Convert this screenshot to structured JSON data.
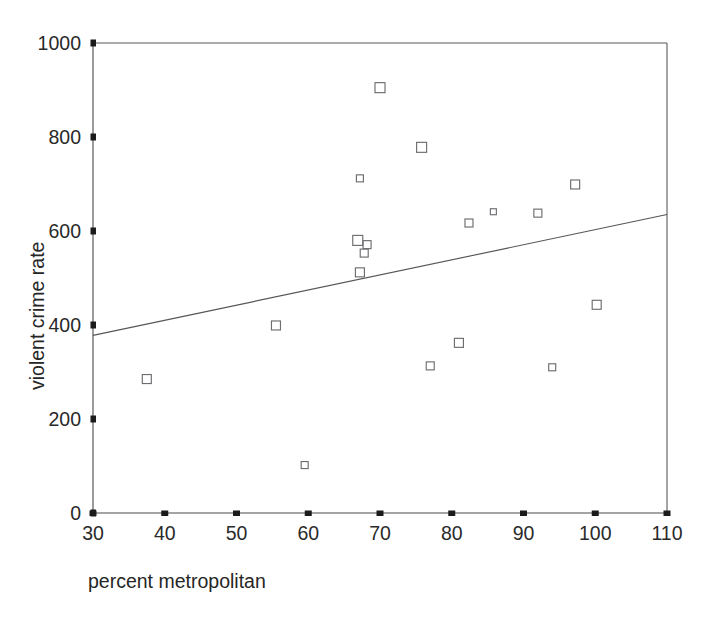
{
  "chart_data": {
    "type": "scatter",
    "title": "",
    "subtitle": "",
    "xlabel": "percent metropolitan",
    "ylabel": "violent crime rate",
    "xlim": [
      30,
      110
    ],
    "ylim": [
      0,
      1000
    ],
    "xticks": [
      30,
      40,
      50,
      60,
      70,
      80,
      90,
      100,
      110
    ],
    "yticks": [
      0,
      200,
      400,
      600,
      800,
      1000
    ],
    "xtick_labels": [
      "30",
      "40",
      "50",
      "60",
      "70",
      "80",
      "90",
      "100",
      "110"
    ],
    "ytick_labels": [
      "0",
      "200",
      "400",
      "600",
      "800",
      "1000"
    ],
    "grid": false,
    "legend": null,
    "legend_position": "none",
    "marker": "open-square",
    "marker_color": "#6e6e72",
    "points": [
      {
        "x": 37.5,
        "y": 285
      },
      {
        "x": 55.5,
        "y": 399
      },
      {
        "x": 59.5,
        "y": 102
      },
      {
        "x": 66.9,
        "y": 580
      },
      {
        "x": 68.2,
        "y": 571
      },
      {
        "x": 67.8,
        "y": 553
      },
      {
        "x": 67.2,
        "y": 512
      },
      {
        "x": 67.2,
        "y": 712
      },
      {
        "x": 70.0,
        "y": 905
      },
      {
        "x": 75.8,
        "y": 778
      },
      {
        "x": 77.0,
        "y": 313
      },
      {
        "x": 81.0,
        "y": 362
      },
      {
        "x": 82.4,
        "y": 617
      },
      {
        "x": 85.8,
        "y": 641
      },
      {
        "x": 92.0,
        "y": 638
      },
      {
        "x": 94.0,
        "y": 310
      },
      {
        "x": 97.2,
        "y": 699
      },
      {
        "x": 100.2,
        "y": 443
      }
    ],
    "fit_line": {
      "name": "linear-fit",
      "x_start": 30,
      "y_start": 378,
      "x_end": 110,
      "y_end": 635,
      "color": "#555558"
    }
  },
  "axes": {
    "x_axis_name": "x-axis",
    "y_axis_name": "y-axis"
  }
}
